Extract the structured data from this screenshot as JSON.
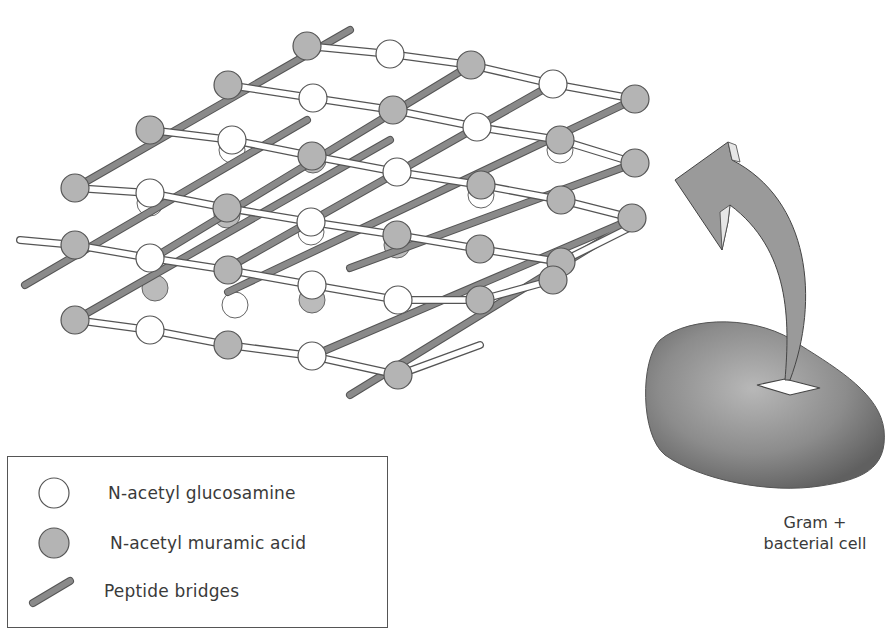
{
  "legend": {
    "items": [
      {
        "key": "nag",
        "label": "N-acetyl glucosamine",
        "symbol": "white-sphere"
      },
      {
        "key": "nam",
        "label": "N-acetyl muramic acid",
        "symbol": "gray-sphere"
      },
      {
        "key": "peptide",
        "label": "Peptide bridges",
        "symbol": "gray-rod"
      }
    ]
  },
  "cell": {
    "caption_line1": "Gram +",
    "caption_line2": "bacterial cell"
  },
  "colors": {
    "nag_fill": "#ffffff",
    "nam_fill": "#b4b4b4",
    "rod_fill": "#8a8a8a",
    "outline": "#555555",
    "cell_fill": "#8f8f8f",
    "arrow_fill": "#9a9a9a"
  }
}
